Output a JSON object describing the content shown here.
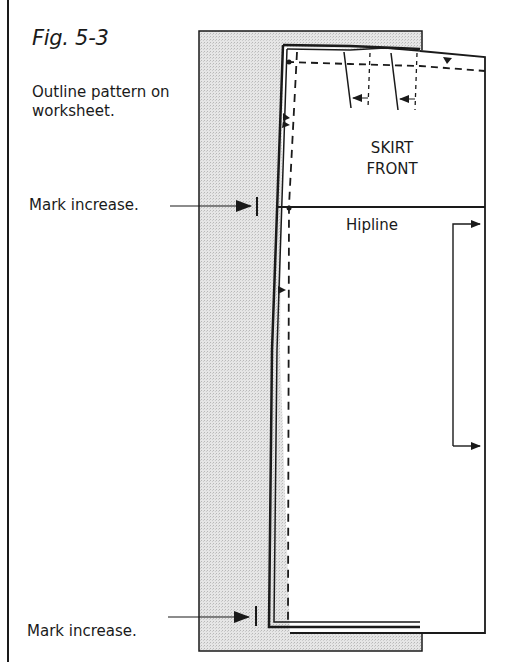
{
  "figure": {
    "title": "Fig. 5-3",
    "caption": "Outline pattern on worksheet."
  },
  "callouts": [
    {
      "text": "Mark increase.",
      "target": "hipline-mark"
    },
    {
      "text": "Mark increase.",
      "target": "hem-mark"
    }
  ],
  "pattern": {
    "piece_label_line1": "SKIRT",
    "piece_label_line2": "FRONT",
    "hipline_label": "Hipline"
  },
  "colors": {
    "ink": "#1a1a1a",
    "worksheet_fill": "#e2e2e2",
    "background": "#ffffff"
  }
}
